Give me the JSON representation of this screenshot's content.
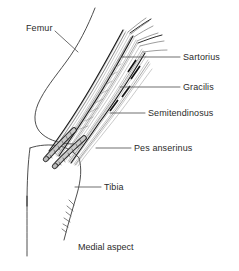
{
  "figure": {
    "caption": "Medial aspect",
    "background_color": "#ffffff",
    "ink_color": "#2b2b2b",
    "type": "anatomical-line-drawing"
  },
  "labels": {
    "femur": "Femur",
    "sartorius": "Sartorius",
    "gracilis": "Gracilis",
    "semitendinosus": "Semitendinosus",
    "pes_anserinus": "Pes anserinus",
    "tibia": "Tibia"
  },
  "structures": [
    {
      "name": "femur",
      "label": "Femur",
      "kind": "bone-outline",
      "side": "left",
      "description": "Distal femur shaft descending to the medial femoral condyle"
    },
    {
      "name": "sartorius",
      "label": "Sartorius",
      "kind": "tendon",
      "side": "right",
      "description": "Most superficial and anterior tendon of the pes anserinus"
    },
    {
      "name": "gracilis",
      "label": "Gracilis",
      "kind": "tendon",
      "side": "right",
      "description": "Middle tendon of the pes anserinus"
    },
    {
      "name": "semitendinosus",
      "label": "Semitendinosus",
      "kind": "tendon",
      "side": "right",
      "description": "Deepest and most posterior tendon of the pes anserinus"
    },
    {
      "name": "pes-anserinus",
      "label": "Pes anserinus",
      "kind": "tendon-insertion",
      "side": "right",
      "description": "Conjoined tendon insertion on the anteromedial proximal tibia"
    },
    {
      "name": "tibia",
      "label": "Tibia",
      "kind": "bone-outline",
      "side": "right",
      "description": "Proximal tibia below the knee joint line"
    }
  ]
}
